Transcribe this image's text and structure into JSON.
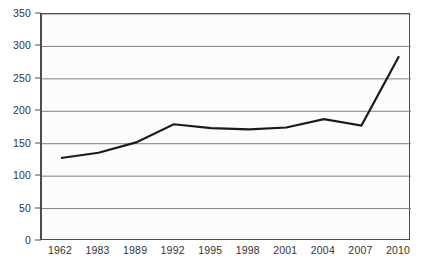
{
  "chart_data": {
    "type": "line",
    "title": "",
    "subtitle": "",
    "xlabel": "",
    "ylabel": "",
    "categories": [
      "1962",
      "1983",
      "1989",
      "1992",
      "1995",
      "1998",
      "2001",
      "2004",
      "2007",
      "2010"
    ],
    "values": [
      128,
      136,
      152,
      180,
      174,
      172,
      175,
      188,
      178,
      285
    ],
    "series": [
      {
        "name": "",
        "values": [
          128,
          136,
          152,
          180,
          174,
          172,
          175,
          188,
          178,
          285
        ]
      }
    ],
    "ylim": [
      0,
      350
    ],
    "yticks": [
      0,
      50,
      100,
      150,
      200,
      250,
      300,
      350
    ],
    "ytick_labels": [
      "0",
      "50",
      "100",
      "150",
      "200",
      "250",
      "300",
      "350"
    ],
    "xtick_labels": [
      "1962",
      "1983",
      "1989",
      "1992",
      "1995",
      "1998",
      "2001",
      "2004",
      "2007",
      "2010"
    ],
    "grid": true,
    "grid_axis": "y",
    "legend": false,
    "legend_position": "none",
    "annotations": [],
    "colors": {
      "line": "#1a1a1a",
      "grid": "#808080",
      "axis": "#4d4d4d",
      "plot_background": "#fcfcfc",
      "page_background": "#ffffff",
      "tick_text": "#333333"
    },
    "line_width": 2.2
  }
}
